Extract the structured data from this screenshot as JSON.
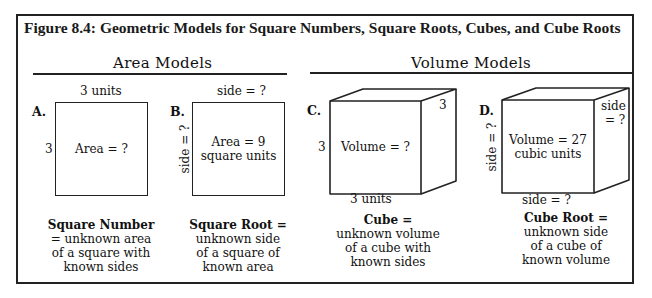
{
  "figure": {
    "title": "Figure 8.4:  Geometric Models for Square Numbers, Square Roots, Cubes, and Cube Roots"
  },
  "sections": {
    "area": {
      "heading": "Area Models"
    },
    "volume": {
      "heading": "Volume Models"
    }
  },
  "models": {
    "a": {
      "letter": "A.",
      "top_label": "3 units",
      "left_label": "3",
      "inner_line1": "Area = ?",
      "caption_bold": "Square Number",
      "caption_lines": [
        "= unknown area",
        "of a square with",
        "known sides"
      ]
    },
    "b": {
      "letter": "B.",
      "top_label": "side = ?",
      "left_label": "side = ?",
      "inner_line1": "Area = 9",
      "inner_line2": "square units",
      "caption_bold": "Square Root =",
      "caption_lines": [
        "unknown side",
        "of a square of",
        "known area"
      ]
    },
    "c": {
      "letter": "C.",
      "depth_label": "3",
      "left_label": "3",
      "bottom_label": "3 units",
      "inner_line1": "Volume = ?",
      "caption_bold": "Cube =",
      "caption_lines": [
        "unknown volume",
        "of a cube with",
        "known sides"
      ]
    },
    "d": {
      "letter": "D.",
      "depth_label_1": "side",
      "depth_label_2": "= ?",
      "left_label": "side = ?",
      "bottom_label": "side = ?",
      "inner_line1": "Volume = 27",
      "inner_line2": "cubic units",
      "caption_bold": "Cube Root =",
      "caption_lines": [
        "unknown side",
        "of a cube of",
        "known volume"
      ]
    }
  }
}
